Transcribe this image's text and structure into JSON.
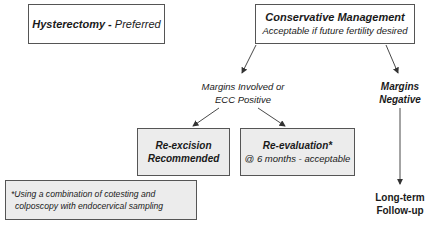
{
  "hysterectomy": {
    "title": "Hysterectomy",
    "separator": " - ",
    "note": "Preferred"
  },
  "conservative": {
    "title": "Conservative Management",
    "note": "Acceptable if future fertility desired"
  },
  "margins_involved": {
    "line1": "Margins Involved or",
    "line2": "ECC Positive"
  },
  "margins_negative": {
    "line1": "Margins",
    "line2": "Negative"
  },
  "reexcision": {
    "line1": "Re-excision",
    "line2": "Recommended"
  },
  "reevaluation": {
    "title": "Re-evaluation*",
    "note": "@ 6 months - acceptable"
  },
  "footnote": {
    "line1": "*Using a combination of cotesting and",
    "line2": "colposcopy with endocervical sampling"
  },
  "followup": {
    "line1": "Long-term",
    "line2": "Follow-up"
  },
  "colors": {
    "border": "#555555",
    "shaded_fill": "#ececec",
    "text": "#1a1a1a",
    "arrow": "#333333"
  }
}
